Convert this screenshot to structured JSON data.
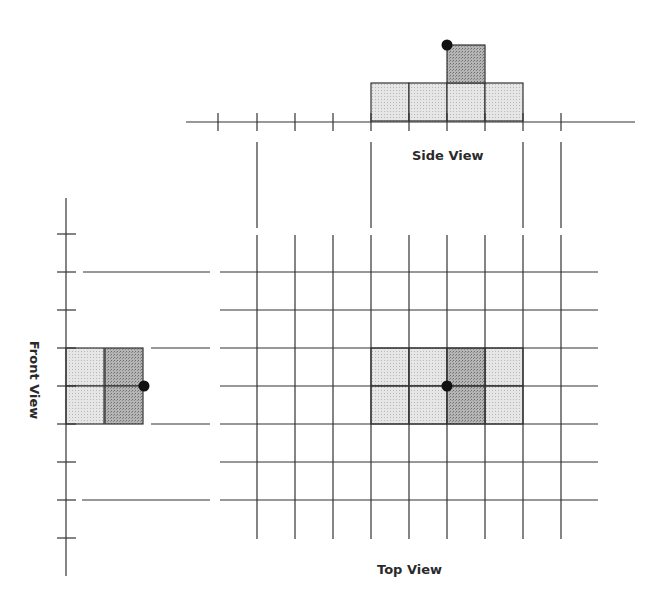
{
  "labels": {
    "side_view": "Side View",
    "top_view": "Top View",
    "front_view": "Front View"
  },
  "colors": {
    "line": "#333333",
    "light_fill": "#dcdcdc",
    "dark_fill": "#a9a9a9",
    "dot": "#111111",
    "background": "#ffffff"
  },
  "grid": {
    "columns_x": [
      257,
      295,
      333,
      371,
      409,
      447,
      485,
      523,
      561
    ],
    "rows_y": [
      272,
      310,
      348,
      386,
      424,
      462,
      500
    ],
    "cell_size": 38
  },
  "side_view": {
    "axis_ticks_x": [
      218,
      257,
      295,
      333,
      371,
      409,
      447,
      485,
      523,
      561
    ],
    "light_cells": [
      [
        371,
        83
      ],
      [
        409,
        83
      ],
      [
        447,
        83
      ],
      [
        485,
        83
      ]
    ],
    "dark_cells": [
      [
        447,
        45
      ]
    ],
    "dot": [
      447,
      45
    ]
  },
  "top_view": {
    "light_cells": [
      [
        371,
        348
      ],
      [
        409,
        348
      ],
      [
        485,
        348
      ],
      [
        371,
        386
      ],
      [
        409,
        386
      ],
      [
        485,
        386
      ]
    ],
    "dark_cells": [
      [
        447,
        348
      ],
      [
        447,
        386
      ]
    ],
    "dot": [
      447,
      386
    ]
  },
  "front_view": {
    "axis_ticks_y": [
      234,
      272,
      310,
      348,
      386,
      424,
      462,
      500,
      538
    ],
    "light_cells": [
      [
        66,
        348
      ],
      [
        66,
        386
      ]
    ],
    "dark_cells": [
      [
        105,
        348
      ],
      [
        105,
        386
      ]
    ],
    "dot": [
      144,
      386
    ]
  }
}
